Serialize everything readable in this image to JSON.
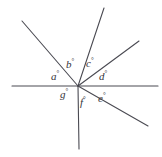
{
  "figure": {
    "type": "geometry-diagram",
    "background_color": "#ffffff",
    "stroke_color": "#4a4a52",
    "label_color": "#35353a",
    "stroke_width": 1.1,
    "width": 162,
    "height": 157,
    "vertex": {
      "x": 78,
      "y": 86
    },
    "degree_symbol": "°",
    "lines": [
      {
        "name": "horizontal-line",
        "x1": 12,
        "y1": 86,
        "x2": 158,
        "y2": 86
      },
      {
        "name": "ray-upper-left",
        "x1": 78,
        "y1": 86,
        "x2": 22,
        "y2": 21
      },
      {
        "name": "ray-steep-up-right",
        "x1": 78,
        "y1": 86,
        "x2": 104,
        "y2": 8
      },
      {
        "name": "ray-diagonal-up-right",
        "x1": 78,
        "y1": 86,
        "x2": 139,
        "y2": 41
      },
      {
        "name": "ray-diagonal-down-right",
        "x1": 78,
        "y1": 86,
        "x2": 148,
        "y2": 126
      },
      {
        "name": "ray-down-vertical",
        "x1": 78,
        "y1": 86,
        "x2": 79,
        "y2": 149
      }
    ],
    "labels": [
      {
        "name": "angle-label-a",
        "letter": "a",
        "x": 51,
        "y": 70
      },
      {
        "name": "angle-label-b",
        "letter": "b",
        "x": 66,
        "y": 58
      },
      {
        "name": "angle-label-c",
        "letter": "c",
        "x": 86,
        "y": 57
      },
      {
        "name": "angle-label-d",
        "letter": "d",
        "x": 99,
        "y": 70
      },
      {
        "name": "angle-label-e",
        "letter": "e",
        "x": 98,
        "y": 92
      },
      {
        "name": "angle-label-f",
        "letter": "f",
        "x": 80,
        "y": 96
      },
      {
        "name": "angle-label-g",
        "letter": "g",
        "x": 60,
        "y": 88
      }
    ]
  }
}
